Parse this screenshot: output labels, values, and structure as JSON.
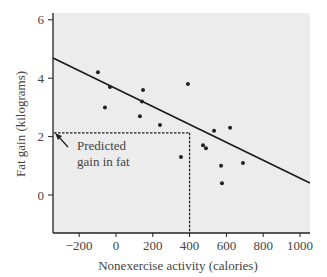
{
  "chart_data": {
    "type": "scatter",
    "title": "",
    "xlabel": "Nonexercise activity (calories)",
    "ylabel": "Fat gain (kilograms)",
    "xlim": [
      -345,
      1060
    ],
    "ylim": [
      -1.3,
      6.2
    ],
    "x_ticks": [
      -200,
      0,
      200,
      400,
      600,
      800,
      1000
    ],
    "y_ticks": [
      0,
      2,
      4,
      6
    ],
    "x_tick_labels": [
      "−200",
      "0",
      "200",
      "400",
      "600",
      "800",
      "1000"
    ],
    "y_tick_labels": [
      "0",
      "2",
      "4",
      "6"
    ],
    "grid": false,
    "background": "#ececec",
    "series": [
      {
        "name": "observations",
        "points": [
          {
            "x": -98,
            "y": 4.2
          },
          {
            "x": -33,
            "y": 3.7
          },
          {
            "x": -60,
            "y": 3.0
          },
          {
            "x": 147,
            "y": 3.6
          },
          {
            "x": 141,
            "y": 3.2
          },
          {
            "x": 130,
            "y": 2.7
          },
          {
            "x": 239,
            "y": 2.4
          },
          {
            "x": 391,
            "y": 3.8
          },
          {
            "x": 533,
            "y": 2.2
          },
          {
            "x": 620,
            "y": 2.3
          },
          {
            "x": 473,
            "y": 1.7
          },
          {
            "x": 489,
            "y": 1.6
          },
          {
            "x": 353,
            "y": 1.3
          },
          {
            "x": 571,
            "y": 1.0
          },
          {
            "x": 576,
            "y": 0.4
          },
          {
            "x": 690,
            "y": 1.1
          }
        ]
      }
    ],
    "regression_line": {
      "x_start": -342,
      "y_start": 4.69,
      "x_end": 1054,
      "y_end": 0.41
    },
    "prediction": {
      "x": 400,
      "y": 2.13,
      "annotation_lines": [
        "Predicted",
        "gain in fat"
      ]
    },
    "legend": null
  }
}
